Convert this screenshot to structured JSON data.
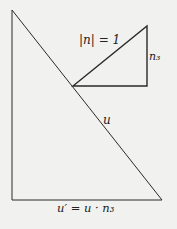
{
  "diagram": {
    "colors": {
      "background": "#f1f1ef",
      "stroke": "#2a2a2a",
      "text": "#222222"
    },
    "big_triangle": {
      "vertices": [
        [
          12,
          10
        ],
        [
          12,
          200
        ],
        [
          162,
          200
        ]
      ],
      "hypotenuse_label": "u",
      "base_label": "u′ = u · n₃"
    },
    "small_triangle": {
      "vertices": [
        [
          73,
          86
        ],
        [
          147,
          86
        ],
        [
          147,
          26
        ]
      ],
      "hypotenuse_label": "|n| = 1",
      "vertical_leg_label": "n₃"
    }
  }
}
